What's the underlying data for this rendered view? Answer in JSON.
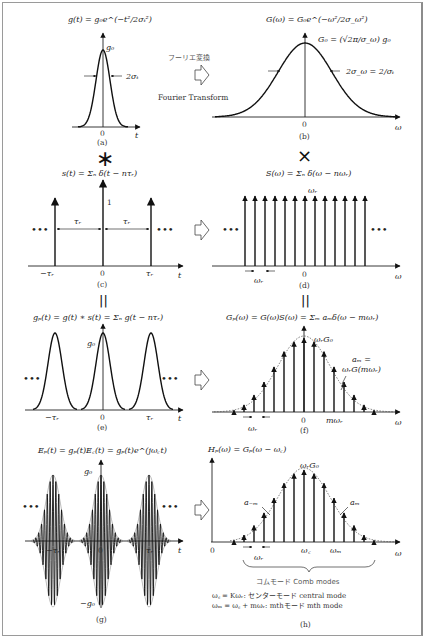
{
  "figure": {
    "colors": {
      "line": "#111111",
      "border": "#9a9a9a",
      "text": "#222222",
      "jp_text": "#555555"
    }
  },
  "panels": {
    "a": {
      "caption": "(a)",
      "equation": "g(t) = g₀e^(−t²/2σₜ²)",
      "peak_label": "g₀",
      "width_label": "2σₜ",
      "x_axis": "t",
      "origin": "0"
    },
    "b": {
      "caption": "(b)",
      "equation": "G(ω) = G₀e^(−ω²/2σ_ω²)",
      "peak_label": "G₀ = (√2π/σ_ω) g₀",
      "width_label": "2σ_ω = 2/σₜ",
      "x_axis": "ω",
      "origin": "0"
    },
    "c": {
      "caption": "(c)",
      "equation": "s(t) = Σₙ δ(t − nτᵣ)",
      "unit_label": "1",
      "spacing_label": "τᵣ",
      "ticks": [
        "−τᵣ",
        "0",
        "τᵣ"
      ],
      "x_axis": "t",
      "ellipsis": "•••"
    },
    "d": {
      "caption": "(d)",
      "equation": "S(ω) = Σₙ δ(ω − nωᵣ)",
      "top_label": "ωᵣ",
      "spacing_label": "ωᵣ",
      "origin": "0",
      "x_axis": "ω",
      "ellipsis": "•••",
      "stem_count": 13
    },
    "e": {
      "caption": "(e)",
      "equation": "gₚ(t) = g(t) ∗ s(t) = Σₙ g(t − nτᵣ)",
      "peak_label": "g₀",
      "ticks": [
        "−τᵣ",
        "0",
        "τᵣ"
      ],
      "x_axis": "t",
      "ellipsis": "•••"
    },
    "f": {
      "caption": "(f)",
      "equation": "Gₚ(ω) = G(ω)S(ω) = Σₘ aₘδ(ω − mωᵣ)",
      "peak_label": "ωᵣG₀",
      "am_label_1": "aₘ =",
      "am_label_2": "ωᵣG(mωᵣ)",
      "spacing_label": "ωᵣ",
      "origin": "0",
      "m_label": "mωᵣ",
      "x_axis": "ω",
      "stem_heights": [
        0.05,
        0.12,
        0.25,
        0.42,
        0.62,
        0.82,
        0.95,
        1.0,
        0.95,
        0.82,
        0.62,
        0.42,
        0.25,
        0.12,
        0.05
      ]
    },
    "g": {
      "caption": "(g)",
      "equation": "Eₚ(t) = gₚ(t)E꜀(t) = gₚ(t)e^(jω꜀t)",
      "peak_label": "g₀",
      "neg_peak_label": "−g₀",
      "ticks": [
        "−τᵣ",
        "0",
        "τᵣ"
      ],
      "x_axis": "t",
      "ellipsis": "•••"
    },
    "h": {
      "caption": "(h)",
      "equation": "Hₚ(ω) = Gₚ(ω − ω꜀)",
      "peak_label": "ωᵣG₀",
      "a_neg_label": "a₋ₘ",
      "a_pos_label": "aₘ",
      "spacing_label": "ωᵣ",
      "origin": "0",
      "center_label": "ω꜀",
      "m_label": "ωₘ",
      "x_axis": "ω",
      "brace_label": "コムモード  Comb modes",
      "note_1": "ω꜀ = Kωᵣ: センターモード  central mode",
      "note_2": "ωₘ = ω꜀ + mωᵣ:  mthモード  mth mode"
    }
  },
  "operators": {
    "transform_jp": "フーリエ変換",
    "transform_en": "Fourier Transform",
    "convolution": "∗",
    "multiplication": "×",
    "equals": "||"
  }
}
